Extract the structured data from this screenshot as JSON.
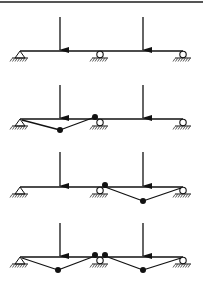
{
  "figure": {
    "top_rule": {
      "y": 2,
      "color": "#555555"
    },
    "beam": {
      "x_start": 20,
      "x_end": 183
    },
    "supports": [
      {
        "type": "pin",
        "x": 20
      },
      {
        "type": "roller",
        "x": 100
      },
      {
        "type": "roller",
        "x": 183
      }
    ],
    "loads_x": [
      60,
      143
    ],
    "rows": [
      {
        "name": "loaded-beam",
        "beam_y": 51,
        "arrow_top": 17,
        "mechanism_lines": [],
        "hinges": []
      },
      {
        "name": "mechanism-span-1",
        "beam_y": 119,
        "arrow_top": 85,
        "mechanism_lines": [
          [
            [
              22,
              120
            ],
            [
              60,
              130
            ]
          ],
          [
            [
              60,
              130
            ],
            [
              95,
              117
            ]
          ]
        ],
        "hinges": [
          [
            60,
            130
          ],
          [
            95,
            117
          ]
        ]
      },
      {
        "name": "mechanism-span-2",
        "beam_y": 187,
        "arrow_top": 152,
        "mechanism_lines": [
          [
            [
              105,
              187
            ],
            [
              143,
              201
            ]
          ],
          [
            [
              143,
              201
            ],
            [
              181,
              188
            ]
          ]
        ],
        "hinges": [
          [
            105,
            185
          ],
          [
            143,
            201
          ]
        ]
      },
      {
        "name": "combined-mechanism",
        "beam_y": 257,
        "arrow_top": 223,
        "mechanism_lines": [
          [
            [
              22,
              258
            ],
            [
              58,
              270
            ]
          ],
          [
            [
              58,
              270
            ],
            [
              95,
              256
            ]
          ],
          [
            [
              105,
              256
            ],
            [
              143,
              270
            ]
          ],
          [
            [
              143,
              270
            ],
            [
              181,
              258
            ]
          ]
        ],
        "hinges": [
          [
            58,
            270
          ],
          [
            95,
            255
          ],
          [
            105,
            255
          ],
          [
            143,
            270
          ]
        ]
      }
    ],
    "colors": {
      "ink": "#111111",
      "background": "#ffffff"
    }
  }
}
